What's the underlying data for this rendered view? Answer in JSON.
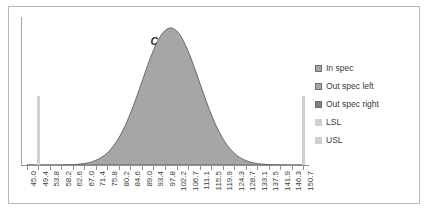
{
  "chart_data": {
    "type": "area",
    "title": "Cp > 1",
    "title_parts": {
      "symbol": "C",
      "subscript": "p",
      "relation": "> 1"
    },
    "xlabel": "",
    "ylabel": "",
    "grid": false,
    "legend_position": "right",
    "x_tick_labels": [
      "45.0",
      "49.4",
      "53.8",
      "58.2",
      "62.6",
      "67.0",
      "71.4",
      "75.8",
      "80.2",
      "84.6",
      "89.0",
      "93.4",
      "97.8",
      "102.2",
      "106.7",
      "111.1",
      "115.5",
      "119.9",
      "124.3",
      "128.7",
      "133.1",
      "137.5",
      "141.9",
      "146.3",
      "150.7"
    ],
    "x": [
      45.0,
      49.4,
      53.8,
      58.2,
      62.6,
      67.0,
      71.4,
      75.8,
      80.2,
      84.6,
      89.0,
      93.4,
      97.8,
      102.2,
      106.7,
      111.1,
      115.5,
      119.9,
      124.3,
      128.7,
      133.1,
      137.5,
      141.9,
      146.3,
      150.7
    ],
    "values": [
      0.2,
      0.4,
      0.8,
      1.6,
      3.0,
      5.6,
      10.0,
      17.0,
      28.0,
      44.0,
      62.0,
      82.0,
      96.0,
      100.0,
      92.0,
      76.0,
      56.0,
      38.0,
      24.0,
      14.0,
      8.0,
      4.4,
      2.4,
      1.2,
      0.6
    ],
    "ylim": [
      0,
      108
    ],
    "xlim": [
      45.0,
      150.7
    ],
    "distribution": {
      "mean": 100.0,
      "sigma": 11.0,
      "peak_value": 100.0
    },
    "markers": [
      {
        "name": "LSL",
        "x": 49.4,
        "height": 70
      },
      {
        "name": "USL",
        "x": 150.7,
        "height": 70
      }
    ],
    "series": [
      {
        "name": "In spec",
        "color": "#a6a6a6"
      },
      {
        "name": "Out spec left",
        "color": "#a6a6a6"
      },
      {
        "name": "Out spec right",
        "color": "#7f7f7f"
      },
      {
        "name": "LSL",
        "color": "#cfcfcf"
      },
      {
        "name": "USL",
        "color": "#cfcfcf"
      }
    ],
    "legend": [
      {
        "label": "In spec",
        "color": "#a6a6a6",
        "style": "boxed"
      },
      {
        "label": "Out spec left",
        "color": "#a6a6a6",
        "style": "boxed"
      },
      {
        "label": "Out spec right",
        "color": "#7f7f7f",
        "style": "boxed"
      },
      {
        "label": "LSL",
        "color": "#cfcfcf",
        "style": "plain"
      },
      {
        "label": "USL",
        "color": "#cfcfcf",
        "style": "plain"
      }
    ]
  },
  "colors": {
    "curve_fill": "#a6a6a6",
    "curve_stroke": "#5b5b5b",
    "spec_bar": "#cfcfcf",
    "axis": "#8f8f8f",
    "frame": "#b9b9b9",
    "text": "#3a3a3a"
  }
}
